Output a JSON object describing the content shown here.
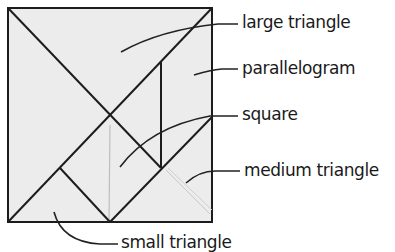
{
  "diagram": {
    "colors": {
      "fill": "#ececec",
      "stroke": "#1c1c1c",
      "leader": "#222222",
      "text": "#1a1a1a"
    },
    "labels": {
      "large_triangle": "large triangle",
      "parallelogram": "parallelogram",
      "square": "square",
      "medium_triangle": "medium triangle",
      "small_triangle": "small triangle"
    }
  }
}
